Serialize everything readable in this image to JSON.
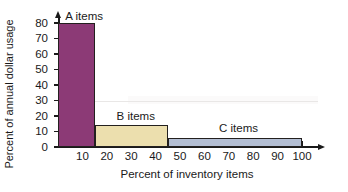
{
  "chart_data": {
    "type": "bar",
    "title": "",
    "subtitle": "",
    "xlabel": "Percent of inventory items",
    "ylabel": "Percent of annual dollar usage",
    "xlim": [
      0,
      100
    ],
    "ylim": [
      0,
      80
    ],
    "grid": false,
    "legend_position": "inline-annotations",
    "xticks": [
      10,
      20,
      30,
      40,
      50,
      60,
      70,
      80,
      90,
      100
    ],
    "yticks": [
      0,
      10,
      20,
      30,
      40,
      50,
      60,
      70,
      80
    ],
    "xtick_labels": [
      "10",
      "20",
      "30",
      "40",
      "50",
      "60",
      "70",
      "80",
      "90",
      "100"
    ],
    "ytick_labels": [
      "80",
      "70",
      "60",
      "50",
      "40",
      "30",
      "20",
      "10",
      "0"
    ],
    "bars": [
      {
        "name": "A items",
        "label": "A items",
        "x_start": 0,
        "x_end": 15,
        "value": 80,
        "color": "#8c3a76",
        "label_left_pct": 3,
        "label_value_pos": 84
      },
      {
        "name": "B items",
        "label": "B items",
        "x_start": 15,
        "x_end": 45,
        "value": 14,
        "color": "#ecdfae",
        "label_left_pct": 24,
        "label_value_pos": 20
      },
      {
        "name": "C items",
        "label": "C items",
        "x_start": 45,
        "x_end": 100,
        "value": 6,
        "color": "#b3bed3",
        "label_left_pct": 66,
        "label_value_pos": 12
      }
    ],
    "annotations": [
      "A items",
      "B items",
      "C items"
    ],
    "colors": {
      "a_items": "#8c3a76",
      "b_items": "#ecdfae",
      "c_items": "#b3bed3",
      "axis": "#1a1a1a",
      "bar_outline": "#23201f",
      "background": "#ffffff"
    }
  }
}
